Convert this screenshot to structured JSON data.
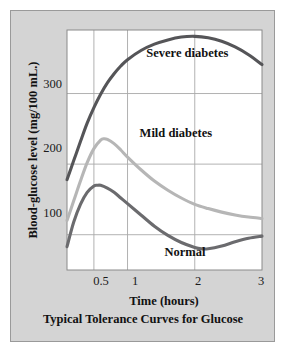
{
  "figure": {
    "caption": "Typical Tolerance Curves for Glucose",
    "background_color": "#d4d4d4",
    "plot_background_color": "#ffffff",
    "border_color": "#9a9a9a"
  },
  "chart_data": {
    "type": "line",
    "title": "Typical Tolerance Curves for Glucose",
    "xlabel": "Time (hours)",
    "ylabel": "Blood-glucose level (mg/100 mL.)",
    "xlim": [
      0.1,
      3.0
    ],
    "ylim": [
      50,
      390
    ],
    "xticks": [
      0.5,
      1,
      2,
      3
    ],
    "xtick_labels": [
      "0.5",
      "1",
      "2",
      "3"
    ],
    "yticks": [
      100,
      200,
      300
    ],
    "ytick_labels": [
      "100",
      "200",
      "300"
    ],
    "grid": true,
    "legend_position": "inline-annotations",
    "series": [
      {
        "name": "Severe diabetes",
        "color": "#555558",
        "label_x": 1.28,
        "label_y": 352,
        "x": [
          0.1,
          0.2,
          0.3,
          0.4,
          0.5,
          0.6,
          0.7,
          0.8,
          0.9,
          1.0,
          1.2,
          1.4,
          1.6,
          1.8,
          2.0,
          2.2,
          2.4,
          2.6,
          2.8,
          3.0
        ],
        "y": [
          178,
          205,
          232,
          258,
          280,
          299,
          315,
          328,
          339,
          348,
          361,
          370,
          376,
          380,
          381,
          379,
          374,
          366,
          355,
          341
        ]
      },
      {
        "name": "Mild diabetes",
        "color": "#b6b6b6",
        "label_x": 1.18,
        "label_y": 238,
        "x": [
          0.1,
          0.2,
          0.3,
          0.4,
          0.5,
          0.6,
          0.65,
          0.7,
          0.8,
          0.9,
          1.0,
          1.2,
          1.4,
          1.6,
          1.8,
          2.0,
          2.2,
          2.4,
          2.6,
          2.8,
          3.0
        ],
        "y": [
          120,
          148,
          176,
          202,
          222,
          234,
          236,
          235,
          229,
          220,
          210,
          192,
          176,
          163,
          152,
          143,
          137,
          132,
          128,
          125,
          123
        ]
      },
      {
        "name": "Normal",
        "color": "#6b6b6e",
        "label_x": 1.55,
        "label_y": 70,
        "x": [
          0.1,
          0.2,
          0.3,
          0.4,
          0.5,
          0.55,
          0.6,
          0.7,
          0.8,
          0.9,
          1.0,
          1.2,
          1.4,
          1.6,
          1.8,
          2.0,
          2.1,
          2.2,
          2.4,
          2.6,
          2.8,
          3.0
        ],
        "y": [
          83,
          118,
          143,
          160,
          169,
          170,
          170,
          166,
          160,
          152,
          144,
          128,
          112,
          99,
          89,
          82,
          80,
          80,
          84,
          90,
          95,
          98
        ]
      }
    ]
  },
  "axes": {
    "y_axis_label": "Blood-glucose level (mg/100 mL.)",
    "x_axis_label": "Time (hours)",
    "y_tick_100": "100",
    "y_tick_200": "200",
    "y_tick_300": "300",
    "x_tick_05": "0.5",
    "x_tick_1": "1",
    "x_tick_2": "2",
    "x_tick_3": "3"
  },
  "annotations": {
    "severe": "Severe diabetes",
    "mild": "Mild diabetes",
    "normal": "Normal"
  }
}
